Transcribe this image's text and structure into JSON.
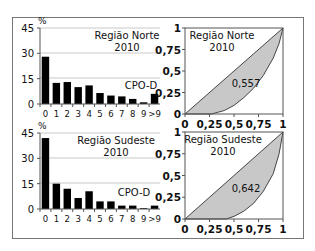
{
  "chart_data": [
    {
      "type": "bar",
      "title": "Região Norte 2010",
      "title_lines": [
        "Região Norte",
        "2010"
      ],
      "annotation": "CPO-D",
      "ylabel": "%",
      "xlabel": "",
      "categories": [
        "0",
        "1",
        "2",
        "3",
        "4",
        "5",
        "6",
        "7",
        "8",
        "9",
        ">9"
      ],
      "values": [
        28,
        12.5,
        13,
        10,
        11,
        6.5,
        5,
        4.5,
        3,
        1,
        6
      ],
      "yticks": [
        0,
        15,
        30,
        45
      ],
      "ylim": [
        0,
        45
      ],
      "grid": true,
      "bar_color": "#000000"
    },
    {
      "type": "area",
      "subtype": "lorenz",
      "title": "Região Norte 2010",
      "title_lines": [
        "Região Norte",
        "2010"
      ],
      "annotation": "0,557",
      "gini": 0.557,
      "xticks": [
        "0",
        "0,25",
        "0,5",
        "0,75",
        "1"
      ],
      "yticks": [
        "0",
        "0,25",
        "0,5",
        "0,75",
        "1"
      ],
      "xlim": [
        0,
        1
      ],
      "ylim": [
        0,
        1
      ],
      "equality_line": [
        [
          0,
          0
        ],
        [
          1,
          1
        ]
      ],
      "lorenz_curve": [
        [
          0,
          0
        ],
        [
          0.27,
          0
        ],
        [
          0.4,
          0.04
        ],
        [
          0.5,
          0.1
        ],
        [
          0.6,
          0.19
        ],
        [
          0.7,
          0.3
        ],
        [
          0.8,
          0.45
        ],
        [
          0.9,
          0.65
        ],
        [
          0.96,
          0.82
        ],
        [
          1,
          1
        ]
      ],
      "fill_color": "#c8c8c8"
    },
    {
      "type": "bar",
      "title": "Região Sudeste 2010",
      "title_lines": [
        "Região Sudeste",
        "2010"
      ],
      "annotation": "CPO-D",
      "ylabel": "%",
      "xlabel": "",
      "categories": [
        "0",
        "1",
        "2",
        "3",
        "4",
        "5",
        "6",
        "7",
        "8",
        "9",
        ">9"
      ],
      "values": [
        42,
        15,
        12,
        6.5,
        10.5,
        4.5,
        4.5,
        2,
        2,
        0.5,
        2
      ],
      "yticks": [
        0,
        15,
        30,
        45
      ],
      "ylim": [
        0,
        45
      ],
      "grid": true,
      "bar_color": "#000000"
    },
    {
      "type": "area",
      "subtype": "lorenz",
      "title": "Região Sudeste 2010",
      "title_lines": [
        "Região Sudeste",
        "2010"
      ],
      "annotation": "0,642",
      "gini": 0.642,
      "xticks": [
        "0",
        "0,25",
        "0,5",
        "0,75",
        "1"
      ],
      "yticks": [
        "0",
        "0,25",
        "0,5",
        "0,75",
        "1"
      ],
      "xlim": [
        0,
        1
      ],
      "ylim": [
        0,
        1
      ],
      "equality_line": [
        [
          0,
          0
        ],
        [
          1,
          1
        ]
      ],
      "lorenz_curve": [
        [
          0,
          0
        ],
        [
          0.42,
          0
        ],
        [
          0.5,
          0.03
        ],
        [
          0.6,
          0.09
        ],
        [
          0.7,
          0.18
        ],
        [
          0.8,
          0.32
        ],
        [
          0.9,
          0.52
        ],
        [
          0.96,
          0.75
        ],
        [
          1,
          1
        ]
      ],
      "fill_color": "#c8c8c8"
    }
  ]
}
